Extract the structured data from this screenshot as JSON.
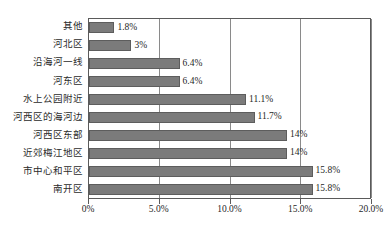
{
  "chart_data": {
    "type": "bar",
    "orientation": "horizontal",
    "title": "",
    "xlabel": "",
    "ylabel": "",
    "xlim": [
      0,
      20
    ],
    "xticks": [
      "0%",
      "5.0%",
      "10.0%",
      "15.0%",
      "20.0%"
    ],
    "xtick_values": [
      0,
      5,
      10,
      15,
      20
    ],
    "grid": true,
    "legend": false,
    "bar_color": "#7b7b7b",
    "bar_edge_color": "#5d5d5d",
    "axis_color": "#5a5a5a",
    "categories": [
      "其他",
      "河北区",
      "沿海河一线",
      "河东区",
      "水上公园附近",
      "河西区的海河边",
      "河西区东部",
      "近郊梅江地区",
      "市中心和平区",
      "南开区"
    ],
    "values": [
      1.8,
      3,
      6.4,
      6.4,
      11.1,
      11.7,
      14,
      14,
      15.8,
      15.8
    ],
    "data_labels": [
      "1.8%",
      "3%",
      "6.4%",
      "6.4%",
      "11.1%",
      "11.7%",
      "14%",
      "14%",
      "15.8%",
      "15.8%"
    ]
  }
}
